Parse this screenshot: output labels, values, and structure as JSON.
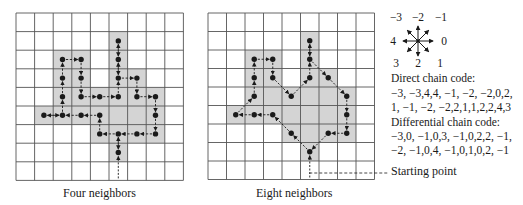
{
  "colors": {
    "grid_line": "#555555",
    "shade": "#d4d4d4",
    "ink": "#1a1a1a"
  },
  "grid": {
    "cols": 9,
    "rows": 9,
    "shaded_cells": [
      [
        5,
        1
      ],
      [
        2,
        2
      ],
      [
        3,
        2
      ],
      [
        5,
        2
      ],
      [
        2,
        3
      ],
      [
        3,
        3
      ],
      [
        5,
        3
      ],
      [
        6,
        3
      ],
      [
        2,
        4
      ],
      [
        3,
        4
      ],
      [
        4,
        4
      ],
      [
        5,
        4
      ],
      [
        6,
        4
      ],
      [
        7,
        4
      ],
      [
        1,
        5
      ],
      [
        2,
        5
      ],
      [
        3,
        5
      ],
      [
        4,
        5
      ],
      [
        5,
        5
      ],
      [
        6,
        5
      ],
      [
        7,
        5
      ],
      [
        4,
        6
      ],
      [
        5,
        6
      ],
      [
        6,
        6
      ],
      [
        7,
        6
      ],
      [
        5,
        7
      ]
    ]
  },
  "panels": [
    {
      "caption": "Four neighbors",
      "origin": [
        16,
        13
      ],
      "cell": 18.6,
      "start": [
        5,
        7
      ],
      "path": [
        [
          5,
          7
        ],
        [
          5,
          6
        ],
        [
          4,
          6
        ],
        [
          4,
          5
        ],
        [
          3,
          5
        ],
        [
          2,
          5
        ],
        [
          1,
          5
        ],
        [
          2,
          5
        ],
        [
          2,
          4
        ],
        [
          2,
          3
        ],
        [
          2,
          2
        ],
        [
          3,
          2
        ],
        [
          3,
          3
        ],
        [
          3,
          4
        ],
        [
          4,
          4
        ],
        [
          5,
          4
        ],
        [
          5,
          3
        ],
        [
          5,
          2
        ],
        [
          5,
          1
        ],
        [
          5,
          2
        ],
        [
          5,
          3
        ],
        [
          6,
          3
        ],
        [
          6,
          4
        ],
        [
          7,
          4
        ],
        [
          7,
          5
        ],
        [
          7,
          6
        ],
        [
          6,
          6
        ],
        [
          5,
          6
        ],
        [
          5,
          7
        ]
      ]
    },
    {
      "caption": "Eight neighbors",
      "origin": [
        208,
        13
      ],
      "cell": 18.5,
      "start": [
        5,
        7
      ],
      "path": [
        [
          5,
          7
        ],
        [
          4,
          6
        ],
        [
          3,
          5
        ],
        [
          2,
          5
        ],
        [
          1,
          5
        ],
        [
          2,
          4
        ],
        [
          2,
          3
        ],
        [
          2,
          2
        ],
        [
          3,
          2
        ],
        [
          3,
          3
        ],
        [
          4,
          4
        ],
        [
          5,
          3
        ],
        [
          5,
          2
        ],
        [
          5,
          1
        ],
        [
          5,
          2
        ],
        [
          6,
          3
        ],
        [
          7,
          4
        ],
        [
          7,
          5
        ],
        [
          7,
          6
        ],
        [
          6,
          6
        ],
        [
          5,
          7
        ]
      ]
    }
  ],
  "compass": {
    "center": [
      418,
      41
    ],
    "labels": [
      {
        "text": "−3",
        "dir": "up-left"
      },
      {
        "text": "−2",
        "dir": "up"
      },
      {
        "text": "−1",
        "dir": "up-right"
      },
      {
        "text": "4",
        "dir": "left"
      },
      {
        "text": "0",
        "dir": "right"
      },
      {
        "text": "3",
        "dir": "down-left"
      },
      {
        "text": "2",
        "dir": "down"
      },
      {
        "text": "1",
        "dir": "down-right"
      }
    ]
  },
  "direct_chain_code": {
    "heading": "Direct chain code:",
    "line1": "−3, −3,4,4, −1, −2, −2,0,2,",
    "line2": "1, −1, −2, −2,2,1,1,2,2,4,3"
  },
  "differential_chain_code": {
    "heading": "Differential chain code:",
    "line1": "−3,0, −1,0,3, −1,0,2,2, −1,",
    "line2": "−2, −1,0,4, −1,0,1,0,2, −1"
  },
  "starting_point_label": "Starting point"
}
